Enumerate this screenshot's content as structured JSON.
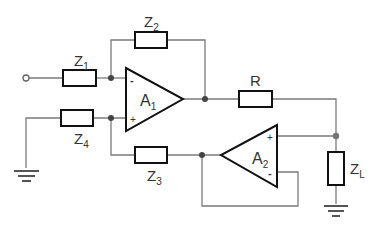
{
  "diagram": {
    "type": "circuit-schematic",
    "components": {
      "Z1": {
        "label": "Z",
        "sub": "1"
      },
      "Z2": {
        "label": "Z",
        "sub": "2"
      },
      "Z3": {
        "label": "Z",
        "sub": "3"
      },
      "Z4": {
        "label": "Z",
        "sub": "4"
      },
      "R": {
        "label": "R"
      },
      "ZL": {
        "label": "Z",
        "sub": "L"
      },
      "A1": {
        "label": "A",
        "sub": "1",
        "inputs": {
          "inverting": "-",
          "noninverting": "+"
        }
      },
      "A2": {
        "label": "A",
        "sub": "2",
        "inputs": {
          "noninverting": "+",
          "inverting": "-"
        }
      }
    },
    "colors": {
      "wire": "#777777",
      "component": "#111111",
      "node": "#444444"
    }
  }
}
